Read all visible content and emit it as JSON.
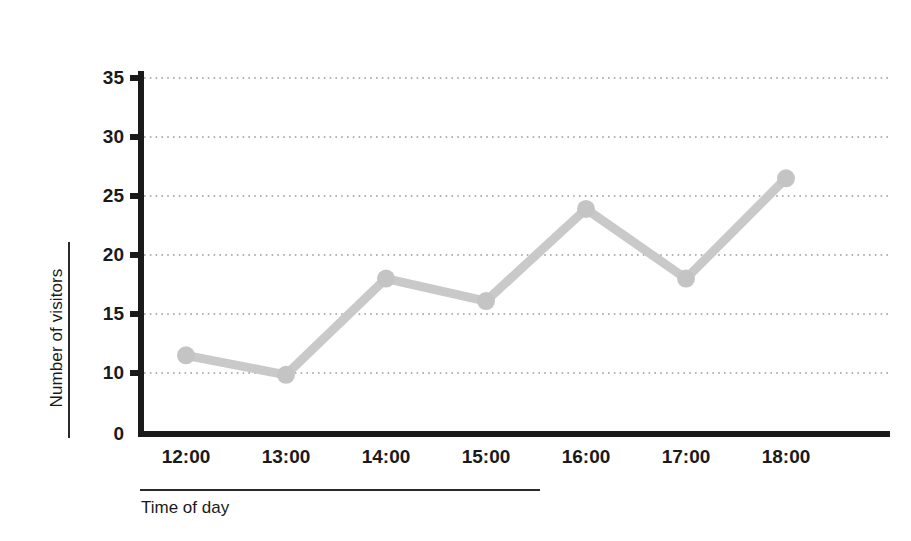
{
  "chart_data": {
    "type": "line",
    "title": "",
    "subtitle": "",
    "xlabel": "Time of day",
    "ylabel": "Number of visitors",
    "categories": [
      "12:00",
      "13:00",
      "14:00",
      "15:00",
      "16:00",
      "17:00",
      "18:00"
    ],
    "values": [
      11.5,
      9.7,
      18.0,
      16.1,
      23.9,
      18.0,
      26.5
    ],
    "series": [
      {
        "name": "Number of visitors",
        "values": [
          11.5,
          9.7,
          18.0,
          16.1,
          23.9,
          18.0,
          26.5
        ]
      }
    ],
    "ylim": [
      0,
      35
    ],
    "y_ticks": [
      0,
      10,
      15,
      20,
      25,
      30,
      35
    ],
    "y_tick_labels": [
      "0",
      "10",
      "15",
      "20",
      "25",
      "30",
      "35"
    ],
    "x_tick_labels": [
      "12:00",
      "13:00",
      "14:00",
      "15:00",
      "16:00",
      "17:00",
      "18:00"
    ],
    "grid": true,
    "grid_style": "dotted-horizontal",
    "legend": "none",
    "legend_position": "none",
    "annotations": [],
    "colors": {
      "line": "#c9c9c9",
      "marker": "#c4c4c4",
      "axis": "#1a1a1a",
      "grid": "#9a9a9a",
      "background": "#ffffff",
      "text": "#1a1a1a"
    }
  },
  "axes": {
    "y_title": "Number of visitors",
    "x_title": "Time of day"
  }
}
